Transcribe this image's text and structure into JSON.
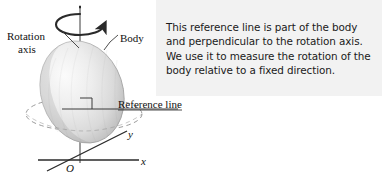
{
  "figure": {
    "title_alt": "Rotation axis and reference line of a rotating rigid body",
    "background_color": "#ffffff",
    "callout": {
      "panel_color": "#f2f2f2",
      "text": "This reference line is part of the body\nand perpendicular to the rotation axis.\nWe use it to measure the rotation of the\nbody relative to a fixed direction.",
      "lines": [
        "This reference line is part of the body",
        "and perpendicular to the rotation axis.",
        "We use it to measure the rotation of the",
        "body relative to a fixed direction."
      ]
    },
    "labels": {
      "rotation_axis_line1": "Rotation",
      "rotation_axis_line2": "axis",
      "body": "Body",
      "reference_line": "Reference line",
      "axis_y": "y",
      "axis_x": "x",
      "origin": "O"
    },
    "colors": {
      "stroke": "#2a2a2a",
      "body_light": "#f4f4f4",
      "body_mid": "#d8d8d8",
      "body_dark": "#9a9a9a",
      "dashed": "#8a8a8a",
      "text": "#111111"
    },
    "elements": {
      "rotation_arrow": "curved-rotation-arrow",
      "ellipsoid": "rigid-body-ellipsoid",
      "dashed_ellipse": "equatorial-dashed-ellipse",
      "right_angle_marker": "right-angle-square",
      "vertical_axis": "rotation-axis-line",
      "reference_line_segment": "reference-line-segment",
      "leader_rotation": "leader-line-rotation-axis",
      "leader_body": "leader-line-body",
      "axis_x_line": "x-axis-line",
      "axis_y_line": "y-axis-line"
    }
  }
}
